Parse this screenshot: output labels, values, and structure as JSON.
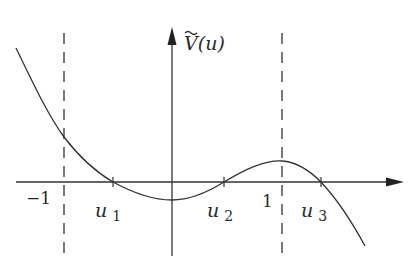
{
  "figure": {
    "type": "function-plot",
    "y_axis_label": "Ṽ(u)",
    "y_axis_label_base": "V",
    "y_axis_label_arg": "(u)",
    "x_tick_labels": {
      "minus_one": "−1",
      "one": "1"
    },
    "roots": [
      {
        "name": "u",
        "sub": "1"
      },
      {
        "name": "u",
        "sub": "2"
      },
      {
        "name": "u",
        "sub": "3"
      }
    ],
    "asymptote_lines": [
      "u = -1",
      "u = 1"
    ],
    "colors": {
      "line": "#333333",
      "background": "#ffffff"
    }
  }
}
